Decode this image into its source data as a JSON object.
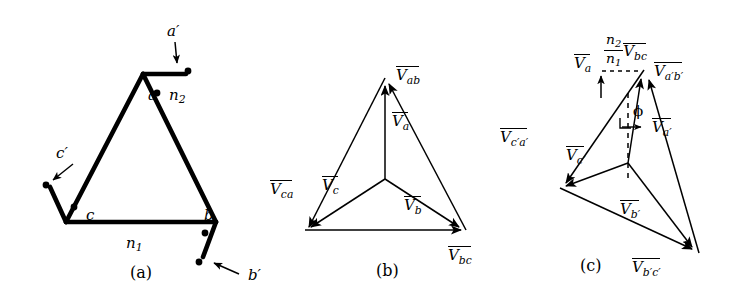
{
  "figure": {
    "panels": [
      {
        "caption": "(a)",
        "kind": "winding-diagram"
      },
      {
        "caption": "(b)",
        "kind": "phasor-diagram-primary"
      },
      {
        "caption": "(c)",
        "kind": "phasor-diagram-secondary"
      }
    ]
  },
  "panel_a": {
    "caption": "(a)",
    "nodes": [
      {
        "id": "a",
        "label": "a"
      },
      {
        "id": "b",
        "label": "b"
      },
      {
        "id": "c",
        "label": "c"
      }
    ],
    "taps": [
      {
        "id": "a-prime",
        "label": "a′"
      },
      {
        "id": "b-prime",
        "label": "b′"
      },
      {
        "id": "c-prime",
        "label": "c′"
      }
    ],
    "turns": [
      {
        "id": "n2",
        "base": "n",
        "sub": "2"
      },
      {
        "id": "n1",
        "base": "n",
        "sub": "1"
      }
    ]
  },
  "panel_b": {
    "caption": "(b)",
    "line_vectors": [
      {
        "id": "V-ab",
        "base": "V",
        "sub": "ab"
      },
      {
        "id": "V-bc",
        "base": "V",
        "sub": "bc"
      },
      {
        "id": "V-ca",
        "base": "V",
        "sub": "ca"
      }
    ],
    "phase_vectors": [
      {
        "id": "V-a",
        "base": "V",
        "sub": "a"
      },
      {
        "id": "V-b",
        "base": "V",
        "sub": "b"
      },
      {
        "id": "V-c",
        "base": "V",
        "sub": "c"
      }
    ]
  },
  "panel_c": {
    "caption": "(c)",
    "line_vectors": [
      {
        "id": "V-apbp",
        "base": "V",
        "sub": "a′b′"
      },
      {
        "id": "V-bpcp",
        "base": "V",
        "sub": "b′c′"
      },
      {
        "id": "V-cpap",
        "base": "V",
        "sub": "c′a′"
      }
    ],
    "phase_vectors": [
      {
        "id": "V-ap",
        "base": "V",
        "sub": "a′"
      },
      {
        "id": "V-bp",
        "base": "V",
        "sub": "b′"
      },
      {
        "id": "V-cp",
        "base": "V",
        "sub": "c′"
      }
    ],
    "reference_vector": {
      "id": "V-a",
      "base": "V",
      "sub": "a"
    },
    "scaled_vector": {
      "id": "n2-over-n1-V-bc",
      "numerator": "n",
      "numerator_sub": "2",
      "denominator": "n",
      "denominator_sub": "1",
      "base": "V",
      "sub": "bc"
    },
    "angle": {
      "id": "phi",
      "symbol": "ϕ"
    }
  },
  "colors": {
    "ink": "#000000",
    "paper": "#ffffff"
  }
}
